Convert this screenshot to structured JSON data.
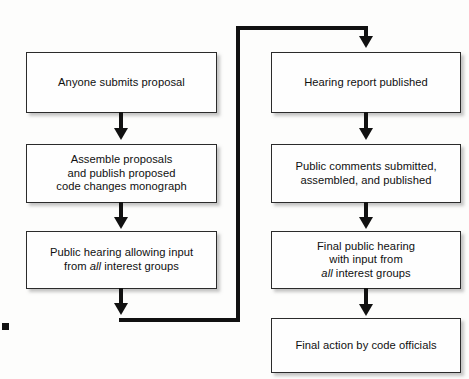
{
  "figure": {
    "type": "flowchart",
    "title": "",
    "orientation": "two-column-with-feedback-loop",
    "background_color": "#fdfdfc",
    "line_color": "#111111",
    "box_border_color": "#2b2b2b",
    "box_fill_color": "#fefefe"
  },
  "nodes": {
    "left": [
      {
        "id": "l1",
        "text": "Anyone submits proposal"
      },
      {
        "id": "l2",
        "text": "Assemble proposals\nand publish proposed\ncode changes monograph"
      },
      {
        "id": "l3",
        "text_before": "Public hearing allowing input\nfrom ",
        "emphasis": "all",
        "text_after": " interest groups"
      }
    ],
    "right": [
      {
        "id": "r1",
        "text": "Hearing report published"
      },
      {
        "id": "r2",
        "text": "Public comments submitted,\nassembled, and published"
      },
      {
        "id": "r3",
        "text_before": "Final public hearing\nwith input from\n",
        "emphasis": "all",
        "text_after": " interest groups"
      },
      {
        "id": "r4",
        "text": "Final action by code officials"
      }
    ]
  },
  "connectors": [
    {
      "from": "l1",
      "to": "l2",
      "style": "straight-down",
      "arrowhead": "down"
    },
    {
      "from": "l2",
      "to": "l3",
      "style": "straight-down",
      "arrowhead": "down"
    },
    {
      "from": "l3",
      "to": "r1",
      "style": "down-right-up-right-down",
      "arrowhead": "down"
    },
    {
      "from": "r1",
      "to": "r2",
      "style": "straight-down",
      "arrowhead": "down"
    },
    {
      "from": "r2",
      "to": "r3",
      "style": "straight-down",
      "arrowhead": "down"
    },
    {
      "from": "r3",
      "to": "r4",
      "style": "straight-down",
      "arrowhead": "down"
    }
  ],
  "artifacts": {
    "margin_mark": ""
  }
}
